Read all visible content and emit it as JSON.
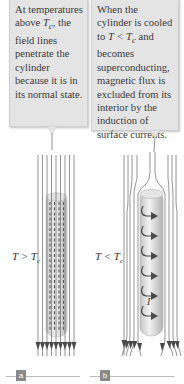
{
  "callouts": {
    "a": {
      "text_before": "At temperatures above ",
      "symbol": "T",
      "subscript": "c",
      "text_after": ", the field lines penetrate the cylinder because it is in its normal state."
    },
    "b": {
      "text_before": "When the cylinder is cooled to ",
      "symbol": "T < T",
      "subscript": "c",
      "text_after": " and becomes superconducting, magnetic flux is excluded from its interior by the induction of surface currents."
    }
  },
  "panels": {
    "a": {
      "label_symbol": "T > T",
      "label_subscript": "c",
      "letter": "a"
    },
    "b": {
      "label_symbol": "T < T",
      "label_subscript": "c",
      "letter": "b",
      "current_label": "I"
    }
  },
  "colors": {
    "callout_bg": "#e4e4e4",
    "field_line": "#7a7a7a",
    "arrow": "#4a4a4a",
    "cylinder": "#d8d8d8",
    "label_box": "#8a8a8a"
  }
}
